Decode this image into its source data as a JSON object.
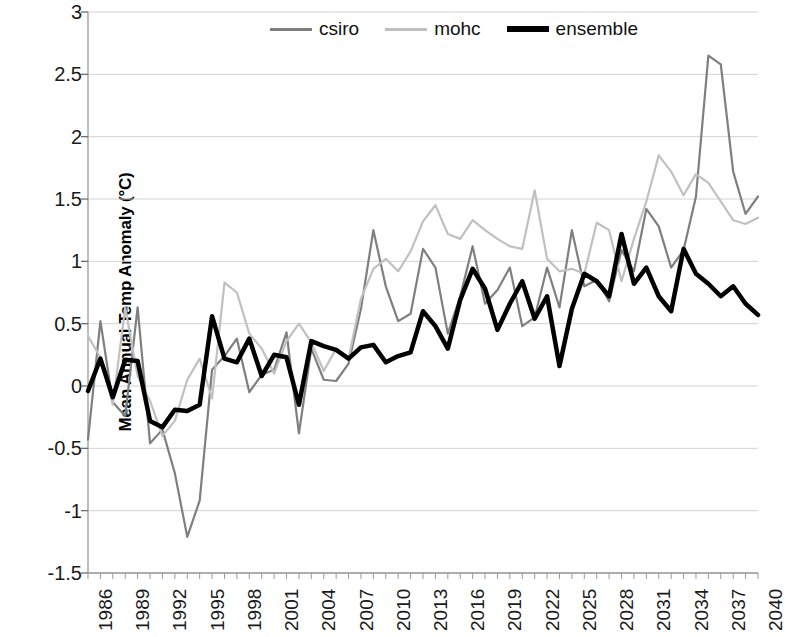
{
  "chart_data": {
    "type": "line",
    "title": "",
    "xlabel": "",
    "ylabel": "Mean Annual Temp Anomaly (°C)",
    "ylim": [
      -1.5,
      3
    ],
    "xlim": [
      1986,
      2040
    ],
    "ytick_labels": [
      "3",
      "2.5",
      "2",
      "1.5",
      "1",
      "0.5",
      "0",
      "-0.5",
      "-1",
      "-1.5"
    ],
    "ytick_values": [
      3,
      2.5,
      2,
      1.5,
      1,
      0.5,
      0,
      -0.5,
      -1,
      -1.5
    ],
    "xtick_labels": [
      "1986",
      "1989",
      "1992",
      "1995",
      "1998",
      "2001",
      "2004",
      "2007",
      "2010",
      "2013",
      "2016",
      "2019",
      "2022",
      "2025",
      "2028",
      "2031",
      "2034",
      "2037",
      "2040"
    ],
    "xtick_values": [
      1986,
      1989,
      1992,
      1995,
      1998,
      2001,
      2004,
      2007,
      2010,
      2013,
      2016,
      2019,
      2022,
      2025,
      2028,
      2031,
      2034,
      2037,
      2040
    ],
    "grid": true,
    "legend_position": "top-center",
    "x": [
      1986,
      1987,
      1988,
      1989,
      1990,
      1991,
      1992,
      1993,
      1994,
      1995,
      1996,
      1997,
      1998,
      1999,
      2000,
      2001,
      2002,
      2003,
      2004,
      2005,
      2006,
      2007,
      2008,
      2009,
      2010,
      2011,
      2012,
      2013,
      2014,
      2015,
      2016,
      2017,
      2018,
      2019,
      2020,
      2021,
      2022,
      2023,
      2024,
      2025,
      2026,
      2027,
      2028,
      2029,
      2030,
      2031,
      2032,
      2033,
      2034,
      2035,
      2036,
      2037,
      2038,
      2039,
      2040
    ],
    "series": [
      {
        "name": "csiro",
        "color": "#7f7f7f",
        "width": 2.2,
        "values": [
          -0.43,
          0.52,
          -0.13,
          -0.24,
          0.63,
          -0.46,
          -0.35,
          -0.7,
          -1.21,
          -0.92,
          0.13,
          0.24,
          0.38,
          -0.05,
          0.09,
          0.13,
          0.43,
          -0.38,
          0.3,
          0.05,
          0.04,
          0.18,
          0.62,
          1.25,
          0.8,
          0.52,
          0.58,
          1.1,
          0.95,
          0.42,
          0.72,
          1.12,
          0.66,
          0.77,
          0.95,
          0.48,
          0.55,
          0.95,
          0.63,
          1.25,
          0.8,
          0.85,
          0.68,
          1.09,
          0.92,
          1.42,
          1.28,
          0.95,
          1.09,
          1.52,
          2.65,
          2.58,
          1.72,
          1.38,
          1.52
        ]
      },
      {
        "name": "mohc",
        "color": "#c0c0c0",
        "width": 2.2,
        "values": [
          0.4,
          0.23,
          -0.15,
          0.63,
          0.08,
          -0.12,
          -0.4,
          -0.28,
          0.05,
          0.22,
          -0.1,
          0.83,
          0.75,
          0.42,
          0.3,
          0.1,
          0.36,
          0.5,
          0.35,
          0.12,
          0.3,
          0.22,
          0.7,
          0.94,
          1.02,
          0.92,
          1.08,
          1.32,
          1.45,
          1.22,
          1.18,
          1.33,
          1.25,
          1.18,
          1.12,
          1.1,
          1.57,
          1.02,
          0.92,
          0.94,
          0.9,
          1.31,
          1.25,
          0.84,
          1.18,
          1.48,
          1.85,
          1.72,
          1.53,
          1.7,
          1.63,
          1.48,
          1.33,
          1.3,
          1.35
        ]
      },
      {
        "name": "ensemble",
        "color": "#000000",
        "width": 4.5,
        "values": [
          -0.04,
          0.22,
          -0.09,
          0.21,
          0.2,
          -0.28,
          -0.33,
          -0.19,
          -0.2,
          -0.15,
          0.56,
          0.22,
          0.19,
          0.38,
          0.08,
          0.25,
          0.23,
          -0.15,
          0.36,
          0.32,
          0.29,
          0.22,
          0.31,
          0.33,
          0.19,
          0.24,
          0.27,
          0.6,
          0.48,
          0.3,
          0.69,
          0.94,
          0.78,
          0.45,
          0.66,
          0.84,
          0.54,
          0.72,
          0.16,
          0.62,
          0.9,
          0.84,
          0.72,
          1.22,
          0.82,
          0.95,
          0.72,
          0.6,
          1.1,
          0.9,
          0.82,
          0.72,
          0.8,
          0.66,
          0.57
        ]
      }
    ]
  },
  "legend": {
    "items": [
      {
        "label": "csiro"
      },
      {
        "label": "mohc"
      },
      {
        "label": "ensemble"
      }
    ]
  }
}
